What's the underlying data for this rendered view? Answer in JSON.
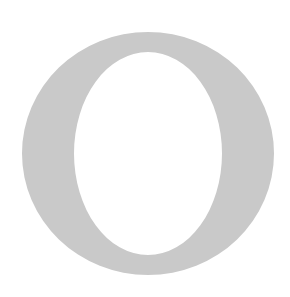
{
  "image": {
    "letter": "O",
    "letter_color": "#c9c9c9",
    "background_color": "#ffffff",
    "outer": {
      "cx": 148,
      "cy": 153.5,
      "rx": 126,
      "ry": 121.5
    },
    "inner": {
      "cx": 148,
      "cy": 153.5,
      "rx": 74,
      "ry": 101.5
    }
  }
}
